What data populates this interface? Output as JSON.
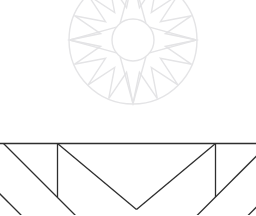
{
  "canvas": {
    "width": 256,
    "height": 215,
    "background": "#ffffff"
  },
  "mandala": {
    "description": "faint 16-point compass star mandala, top edge clipped",
    "stroke": "#e4e4e6",
    "stroke_width": 1.4,
    "center_x": 133,
    "center_y": 40,
    "outer_radius": 64,
    "inner_radius": 21,
    "valley_radius": 33,
    "tip_count": 16,
    "cardinal_angles": [
      -90,
      0,
      90,
      180
    ],
    "cardinal_base_half_angle": 38
  },
  "facet_pattern": {
    "description": "dark line facet/tangram pattern along bottom band",
    "stroke": "#2e2e2e",
    "stroke_width": 1.3,
    "lines": [
      {
        "name": "top-horizontal-line",
        "x1": -0.5,
        "y1": 143.5,
        "x2": 256.5,
        "y2": 143.5
      },
      {
        "name": "left-vertical-line",
        "x1": 57.5,
        "y1": 143.5,
        "x2": 57.5,
        "y2": 197
      },
      {
        "name": "right-vertical-line",
        "x1": 215.5,
        "y1": 143.5,
        "x2": 215.5,
        "y2": 197
      },
      {
        "name": "v-left-arm",
        "x1": 57.5,
        "y1": 143.5,
        "x2": 136.5,
        "y2": 209.5
      },
      {
        "name": "v-right-arm",
        "x1": 215.5,
        "y1": 143.5,
        "x2": 136.5,
        "y2": 209.5
      },
      {
        "name": "left-outer-diagonal",
        "x1": 3.5,
        "y1": 143.5,
        "x2": 75.5,
        "y2": 215.5
      },
      {
        "name": "left-corner-diagonal",
        "x1": -0.5,
        "y1": 193.5,
        "x2": 21.5,
        "y2": 215.5
      },
      {
        "name": "right-outer-diagonal",
        "x1": 256.5,
        "y1": 156,
        "x2": 197,
        "y2": 215.5
      },
      {
        "name": "right-corner-diagonal",
        "x1": 256.5,
        "y1": 207,
        "x2": 248,
        "y2": 215.5
      }
    ]
  }
}
